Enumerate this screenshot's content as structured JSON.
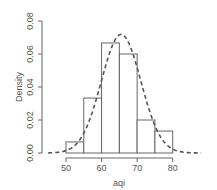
{
  "chart_data": {
    "type": "bar",
    "subtype": "histogram_with_density_curve",
    "title": "",
    "xlabel": "aqi",
    "ylabel": "Density",
    "xlim": [
      45,
      88
    ],
    "ylim": [
      0,
      0.08
    ],
    "x_ticks": [
      "50",
      "60",
      "70",
      "80"
    ],
    "y_ticks": [
      "0.00",
      "0.02",
      "0.04",
      "0.06",
      "0.08"
    ],
    "bins": [
      [
        50,
        55
      ],
      [
        55,
        60
      ],
      [
        60,
        65
      ],
      [
        65,
        70
      ],
      [
        70,
        75
      ],
      [
        75,
        80
      ]
    ],
    "categories": [
      "50-55",
      "55-60",
      "60-65",
      "65-70",
      "70-75",
      "75-80"
    ],
    "values": [
      0.0067,
      0.0333,
      0.0667,
      0.06,
      0.02,
      0.0133
    ],
    "series": [
      {
        "name": "histogram",
        "type": "bar",
        "values": [
          0.0067,
          0.0333,
          0.0667,
          0.06,
          0.02,
          0.0133
        ]
      },
      {
        "name": "normal density",
        "type": "line",
        "style": "dashed",
        "mean": 65.5,
        "sd": 5.55,
        "peak": 0.072
      }
    ],
    "grid": false,
    "legend": "none"
  },
  "colors": {
    "bar_border": "#666666",
    "bar_fill": "#ffffff",
    "curve": "#555555",
    "axis": "#666666",
    "text": "#555555"
  }
}
